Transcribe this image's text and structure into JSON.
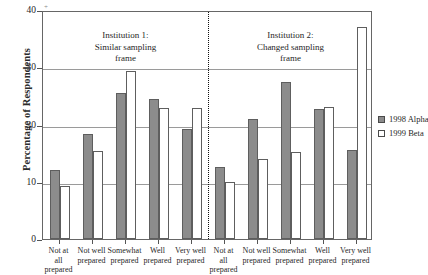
{
  "chart_data": {
    "type": "bar",
    "title": "",
    "xlabel": "",
    "ylabel": "Percentage of Respondents",
    "ylim": [
      0,
      40
    ],
    "yticks": [
      0,
      10,
      20,
      30,
      40
    ],
    "ytick_labels": [
      "0",
      "10",
      "20",
      "30",
      "40"
    ],
    "grid": true,
    "grid_axis": "y",
    "legend_position": "right",
    "categories": [
      "Not at all prepared",
      "Not well prepared",
      "Somewhat prepared",
      "Well prepared",
      "Very well prepared"
    ],
    "panels": [
      {
        "name": "Institution 1: Similar sampling frame",
        "caption_lines": [
          "Institution 1:",
          "Similar sampling",
          "frame"
        ],
        "series": [
          {
            "name": "1998 Alpha",
            "values": [
              12.0,
              18.4,
              25.5,
              24.5,
              19.2
            ]
          },
          {
            "name": "1999 Beta",
            "values": [
              9.2,
              15.3,
              29.3,
              22.9,
              22.9
            ]
          }
        ]
      },
      {
        "name": "Institution 2: Changed sampling frame",
        "caption_lines": [
          "Institution 2:",
          "Changed sampling",
          "frame"
        ],
        "series": [
          {
            "name": "1998 Alpha",
            "values": [
              12.6,
              21.0,
              27.4,
              22.7,
              15.5
            ]
          },
          {
            "name": "1999 Beta",
            "values": [
              10.0,
              14.0,
              15.2,
              23.0,
              37.0
            ]
          }
        ]
      }
    ],
    "series_colors": {
      "1998 Alpha": "#8c8c8c",
      "1999 Beta": "#ffffff"
    },
    "series_edge_color": "#5e5e5e",
    "legend": [
      {
        "label": "1998 Alpha",
        "swatch": "alpha"
      },
      {
        "label": "1999 Beta",
        "swatch": "beta"
      }
    ]
  },
  "axes": {
    "y_title": "Percentage of Respondents"
  },
  "marks": {
    "stray": "+"
  }
}
